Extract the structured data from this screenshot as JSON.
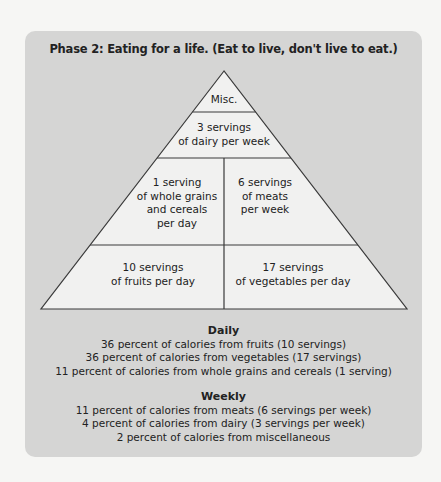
{
  "title": "Phase 2: Eating for a life. (Eat to live, don't live to eat.)",
  "pyramid": {
    "misc": "Misc.",
    "dairy": [
      "3 servings",
      "of dairy per week"
    ],
    "grains": [
      "1 serving",
      "of whole grains",
      "and cereals",
      "per day"
    ],
    "meats": [
      "6 servings",
      "of meats",
      "per week"
    ],
    "fruits": [
      "10 servings",
      "of fruits per day"
    ],
    "vegetables": [
      "17 servings",
      "of vegetables per day"
    ]
  },
  "daily": {
    "heading": "Daily",
    "lines": [
      "36 percent of calories from fruits (10 servings)",
      "36 percent of calories from vegetables (17 servings)",
      "11 percent of calories from whole grains and cereals (1 serving)"
    ]
  },
  "weekly": {
    "heading": "Weekly",
    "lines": [
      "11 percent of calories from meats (6 servings per week)",
      "4 percent of calories from dairy (3 servings per week)",
      "2 percent of calories from miscellaneous"
    ]
  },
  "colors": {
    "panel": "#d5d5d4",
    "pyramid_fill": "#f1f1f0",
    "lines": "#3a3a3a"
  }
}
